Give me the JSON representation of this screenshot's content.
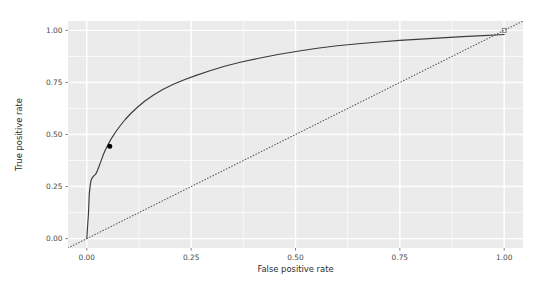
{
  "chart_data": {
    "type": "line",
    "title": "",
    "subtitle": "",
    "xlabel": "False positive rate",
    "ylabel": "True positive rate",
    "xlim": [
      0.0,
      1.0
    ],
    "ylim": [
      0.0,
      1.0
    ],
    "xticks": [
      "0.00",
      "0.25",
      "0.50",
      "0.75",
      "1.00"
    ],
    "xtick_values": [
      0.0,
      0.25,
      0.5,
      0.75,
      1.0
    ],
    "yticks": [
      "0.00",
      "0.25",
      "0.50",
      "0.75",
      "1.00"
    ],
    "ytick_values": [
      0.0,
      0.25,
      0.5,
      0.75,
      1.0
    ],
    "grid": true,
    "grid_major_values": [
      0.0,
      0.25,
      0.5,
      0.75,
      1.0
    ],
    "grid_minor_values": [
      0.125,
      0.375,
      0.625,
      0.875
    ],
    "legend": "none",
    "panel_background": "#ebebeb",
    "grid_major_color": "#ffffff",
    "grid_minor_color": "#ffffff",
    "series": [
      {
        "name": "ROC curve",
        "style": "solid",
        "color": "#3b3b3b",
        "x": [
          0.0,
          0.002,
          0.004,
          0.005,
          0.006,
          0.008,
          0.01,
          0.013,
          0.016,
          0.019,
          0.022,
          0.025,
          0.029,
          0.034,
          0.039,
          0.045,
          0.052,
          0.06,
          0.069,
          0.08,
          0.092,
          0.106,
          0.122,
          0.14,
          0.16,
          0.182,
          0.206,
          0.232,
          0.262,
          0.295,
          0.33,
          0.37,
          0.412,
          0.458,
          0.505,
          0.552,
          0.6,
          0.65,
          0.7,
          0.75,
          0.8,
          0.85,
          0.9,
          0.95,
          1.0
        ],
        "y": [
          0.0,
          0.06,
          0.12,
          0.17,
          0.215,
          0.252,
          0.278,
          0.292,
          0.3,
          0.305,
          0.312,
          0.325,
          0.345,
          0.372,
          0.4,
          0.428,
          0.456,
          0.484,
          0.512,
          0.542,
          0.572,
          0.602,
          0.632,
          0.662,
          0.69,
          0.716,
          0.74,
          0.762,
          0.784,
          0.806,
          0.828,
          0.848,
          0.866,
          0.884,
          0.9,
          0.914,
          0.926,
          0.936,
          0.944,
          0.952,
          0.958,
          0.964,
          0.97,
          0.975,
          0.98
        ]
      },
      {
        "name": "chance diagonal",
        "style": "dotted",
        "color": "#595959",
        "x": [
          -0.045,
          1.045
        ],
        "y": [
          -0.045,
          1.045
        ]
      }
    ],
    "points": [
      {
        "name": "optimal-threshold-point",
        "x": 0.055,
        "y": 0.443,
        "shape": "filled-circle",
        "color": "#000000",
        "size": 4.2
      },
      {
        "name": "endpoint-marker",
        "x": 1.0,
        "y": 1.0,
        "shape": "open-square",
        "color": "#7a7a7a",
        "size": 4.0
      }
    ]
  }
}
